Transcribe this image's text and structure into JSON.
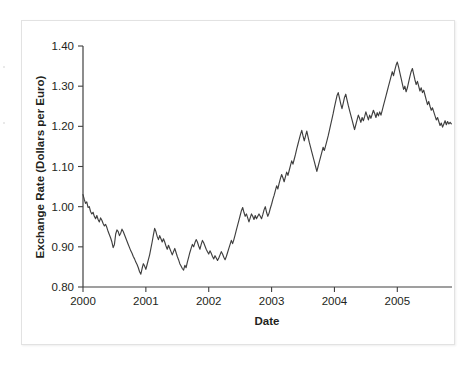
{
  "chart_data": {
    "type": "line",
    "title": "",
    "xlabel": "Date",
    "ylabel": "Exchange Rate (Dollars per Euro)",
    "xlim": [
      2000.0,
      2005.87
    ],
    "ylim": [
      0.8,
      1.4
    ],
    "xticks": [
      2000,
      2001,
      2002,
      2003,
      2004,
      2005
    ],
    "xtick_labels": [
      "2000",
      "2001",
      "2002",
      "2003",
      "2004",
      "2005"
    ],
    "yticks": [
      0.8,
      0.9,
      1.0,
      1.1,
      1.2,
      1.3,
      1.4
    ],
    "ytick_labels": [
      "0.80",
      "0.90",
      "1.00",
      "1.10",
      "1.20",
      "1.30",
      "1.40"
    ],
    "grid": false,
    "legend": null,
    "series": [
      {
        "name": "USD per EUR",
        "color": "#3f3f3f",
        "x": [
          2000.0,
          2000.02,
          2000.04,
          2000.06,
          2000.08,
          2000.1,
          2000.12,
          2000.14,
          2000.16,
          2000.18,
          2000.2,
          2000.22,
          2000.24,
          2000.26,
          2000.28,
          2000.3,
          2000.32,
          2000.34,
          2000.36,
          2000.38,
          2000.4,
          2000.42,
          2000.44,
          2000.46,
          2000.48,
          2000.5,
          2000.52,
          2000.54,
          2000.56,
          2000.58,
          2000.6,
          2000.62,
          2000.64,
          2000.66,
          2000.68,
          2000.7,
          2000.72,
          2000.74,
          2000.76,
          2000.78,
          2000.8,
          2000.82,
          2000.84,
          2000.86,
          2000.88,
          2000.9,
          2000.92,
          2000.94,
          2000.96,
          2000.98,
          2001.0,
          2001.02,
          2001.04,
          2001.06,
          2001.08,
          2001.1,
          2001.12,
          2001.14,
          2001.16,
          2001.18,
          2001.2,
          2001.22,
          2001.24,
          2001.26,
          2001.28,
          2001.3,
          2001.32,
          2001.34,
          2001.36,
          2001.38,
          2001.4,
          2001.42,
          2001.44,
          2001.46,
          2001.48,
          2001.5,
          2001.52,
          2001.54,
          2001.56,
          2001.58,
          2001.6,
          2001.62,
          2001.64,
          2001.66,
          2001.68,
          2001.7,
          2001.72,
          2001.74,
          2001.76,
          2001.78,
          2001.8,
          2001.82,
          2001.84,
          2001.86,
          2001.88,
          2001.9,
          2001.92,
          2001.94,
          2001.96,
          2001.98,
          2002.0,
          2002.02,
          2002.04,
          2002.06,
          2002.08,
          2002.1,
          2002.12,
          2002.14,
          2002.16,
          2002.18,
          2002.2,
          2002.22,
          2002.24,
          2002.26,
          2002.28,
          2002.3,
          2002.32,
          2002.34,
          2002.36,
          2002.38,
          2002.4,
          2002.42,
          2002.44,
          2002.46,
          2002.48,
          2002.5,
          2002.52,
          2002.54,
          2002.56,
          2002.58,
          2002.6,
          2002.62,
          2002.64,
          2002.66,
          2002.68,
          2002.7,
          2002.72,
          2002.74,
          2002.76,
          2002.78,
          2002.8,
          2002.82,
          2002.84,
          2002.86,
          2002.88,
          2002.9,
          2002.92,
          2002.94,
          2002.96,
          2002.98,
          2003.0,
          2003.02,
          2003.04,
          2003.06,
          2003.08,
          2003.1,
          2003.12,
          2003.14,
          2003.16,
          2003.18,
          2003.2,
          2003.22,
          2003.24,
          2003.26,
          2003.28,
          2003.3,
          2003.32,
          2003.34,
          2003.36,
          2003.38,
          2003.4,
          2003.42,
          2003.44,
          2003.46,
          2003.48,
          2003.5,
          2003.52,
          2003.54,
          2003.56,
          2003.58,
          2003.6,
          2003.62,
          2003.64,
          2003.66,
          2003.68,
          2003.7,
          2003.72,
          2003.74,
          2003.76,
          2003.78,
          2003.8,
          2003.82,
          2003.84,
          2003.86,
          2003.88,
          2003.9,
          2003.92,
          2003.94,
          2003.96,
          2003.98,
          2004.0,
          2004.02,
          2004.04,
          2004.06,
          2004.08,
          2004.1,
          2004.12,
          2004.14,
          2004.16,
          2004.18,
          2004.2,
          2004.22,
          2004.24,
          2004.26,
          2004.28,
          2004.3,
          2004.32,
          2004.34,
          2004.36,
          2004.38,
          2004.4,
          2004.42,
          2004.44,
          2004.46,
          2004.48,
          2004.5,
          2004.52,
          2004.54,
          2004.56,
          2004.58,
          2004.6,
          2004.62,
          2004.64,
          2004.66,
          2004.68,
          2004.7,
          2004.72,
          2004.74,
          2004.76,
          2004.78,
          2004.8,
          2004.82,
          2004.84,
          2004.86,
          2004.88,
          2004.9,
          2004.92,
          2004.94,
          2004.96,
          2004.98,
          2005.0,
          2005.02,
          2005.04,
          2005.06,
          2005.08,
          2005.1,
          2005.12,
          2005.14,
          2005.16,
          2005.18,
          2005.2,
          2005.22,
          2005.24,
          2005.26,
          2005.28,
          2005.3,
          2005.32,
          2005.34,
          2005.36,
          2005.38,
          2005.4,
          2005.42,
          2005.44,
          2005.46,
          2005.48,
          2005.5,
          2005.52,
          2005.54,
          2005.56,
          2005.58,
          2005.6,
          2005.62,
          2005.64,
          2005.66,
          2005.68,
          2005.7,
          2005.72,
          2005.74,
          2005.76,
          2005.78,
          2005.8,
          2005.82,
          2005.84,
          2005.86
        ],
        "y": [
          1.03,
          1.018,
          1.008,
          1.012,
          0.998,
          1.0,
          0.988,
          0.982,
          0.986,
          0.976,
          0.97,
          0.978,
          0.968,
          0.962,
          0.972,
          0.966,
          0.958,
          0.952,
          0.956,
          0.948,
          0.938,
          0.93,
          0.922,
          0.912,
          0.898,
          0.906,
          0.932,
          0.942,
          0.938,
          0.928,
          0.934,
          0.944,
          0.938,
          0.93,
          0.922,
          0.914,
          0.906,
          0.898,
          0.89,
          0.884,
          0.876,
          0.87,
          0.862,
          0.856,
          0.848,
          0.838,
          0.832,
          0.846,
          0.858,
          0.852,
          0.844,
          0.856,
          0.868,
          0.88,
          0.896,
          0.912,
          0.93,
          0.946,
          0.938,
          0.926,
          0.918,
          0.928,
          0.92,
          0.912,
          0.92,
          0.912,
          0.902,
          0.894,
          0.904,
          0.896,
          0.888,
          0.88,
          0.888,
          0.896,
          0.886,
          0.876,
          0.868,
          0.858,
          0.852,
          0.846,
          0.842,
          0.854,
          0.848,
          0.862,
          0.874,
          0.886,
          0.896,
          0.906,
          0.9,
          0.91,
          0.918,
          0.912,
          0.902,
          0.894,
          0.906,
          0.916,
          0.91,
          0.902,
          0.894,
          0.888,
          0.882,
          0.89,
          0.884,
          0.876,
          0.87,
          0.878,
          0.872,
          0.866,
          0.872,
          0.88,
          0.888,
          0.882,
          0.874,
          0.868,
          0.876,
          0.886,
          0.896,
          0.906,
          0.916,
          0.908,
          0.918,
          0.93,
          0.942,
          0.954,
          0.966,
          0.978,
          0.99,
          0.998,
          0.986,
          0.976,
          0.982,
          0.972,
          0.962,
          0.972,
          0.982,
          0.976,
          0.968,
          0.978,
          0.97,
          0.976,
          0.982,
          0.976,
          0.97,
          0.98,
          0.992,
          1.0,
          0.986,
          0.976,
          0.984,
          0.996,
          1.006,
          1.018,
          1.028,
          1.04,
          1.052,
          1.044,
          1.058,
          1.07,
          1.08,
          1.072,
          1.062,
          1.074,
          1.086,
          1.078,
          1.09,
          1.102,
          1.114,
          1.106,
          1.118,
          1.13,
          1.144,
          1.156,
          1.168,
          1.18,
          1.19,
          1.176,
          1.164,
          1.176,
          1.188,
          1.174,
          1.16,
          1.148,
          1.136,
          1.124,
          1.112,
          1.1,
          1.088,
          1.1,
          1.112,
          1.124,
          1.136,
          1.148,
          1.14,
          1.152,
          1.164,
          1.176,
          1.19,
          1.204,
          1.218,
          1.232,
          1.248,
          1.262,
          1.276,
          1.284,
          1.27,
          1.256,
          1.244,
          1.258,
          1.272,
          1.28,
          1.266,
          1.252,
          1.24,
          1.228,
          1.216,
          1.204,
          1.192,
          1.204,
          1.216,
          1.228,
          1.22,
          1.21,
          1.222,
          1.214,
          1.224,
          1.236,
          1.226,
          1.216,
          1.228,
          1.22,
          1.23,
          1.24,
          1.232,
          1.222,
          1.234,
          1.226,
          1.236,
          1.228,
          1.24,
          1.252,
          1.264,
          1.276,
          1.288,
          1.3,
          1.312,
          1.324,
          1.336,
          1.326,
          1.34,
          1.352,
          1.36,
          1.348,
          1.334,
          1.32,
          1.306,
          1.292,
          1.3,
          1.286,
          1.296,
          1.31,
          1.324,
          1.336,
          1.344,
          1.33,
          1.316,
          1.304,
          1.312,
          1.3,
          1.288,
          1.296,
          1.284,
          1.29,
          1.278,
          1.266,
          1.254,
          1.262,
          1.25,
          1.24,
          1.246,
          1.236,
          1.226,
          1.216,
          1.222,
          1.212,
          1.202,
          1.208,
          1.198,
          1.206,
          1.214,
          1.204,
          1.212,
          1.206,
          1.21,
          1.206
        ]
      }
    ]
  },
  "axes": {
    "x_title": "Date",
    "y_title": "Exchange Rate (Dollars per Euro)"
  }
}
